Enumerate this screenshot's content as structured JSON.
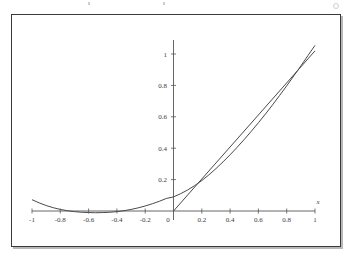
{
  "figure": {
    "frame_border_color": "#3a3a3a",
    "shadow_color": "#b8b8b8",
    "background": "#ffffff"
  },
  "chart_data": {
    "type": "line",
    "title": "",
    "subtitle": "",
    "xlabel": "x",
    "ylabel": "",
    "grid": false,
    "legend": false,
    "legend_position": "none",
    "xlim": [
      -1,
      1
    ],
    "ylim": [
      -0.06,
      1.08
    ],
    "x_ticks": [
      -1,
      -0.8,
      -0.6,
      -0.4,
      -0.2,
      0,
      0.2,
      0.4,
      0.6,
      0.8,
      1
    ],
    "x_tick_labels": [
      "-1",
      "-0.8",
      "-0.6",
      "-0.4",
      "-0.2",
      "0",
      "0.2",
      "0.4",
      "0.6",
      "0.8",
      "1"
    ],
    "y_ticks": [
      0.2,
      0.4,
      0.6,
      0.8,
      1
    ],
    "y_tick_labels": [
      "0.2",
      "0.4",
      "0.6",
      "0.8",
      "1"
    ],
    "axis_color": "#555555",
    "curve_color": "#4a4a4a",
    "series": [
      {
        "name": "curve",
        "kind": "curve",
        "color": "#4a4a4a",
        "x": [
          -1.0,
          -0.95,
          -0.9,
          -0.85,
          -0.8,
          -0.75,
          -0.7,
          -0.65,
          -0.6,
          -0.55,
          -0.5,
          -0.45,
          -0.4,
          -0.35,
          -0.3,
          -0.25,
          -0.2,
          -0.15,
          -0.1,
          -0.05,
          0.0,
          0.05,
          0.1,
          0.15,
          0.2,
          0.25,
          0.3,
          0.35,
          0.4,
          0.45,
          0.5,
          0.55,
          0.6,
          0.65,
          0.7,
          0.75,
          0.8,
          0.85,
          0.9,
          0.95,
          1.0
        ],
        "y": [
          0.072,
          0.052,
          0.035,
          0.021,
          0.01,
          0.002,
          -0.004,
          -0.008,
          -0.01,
          -0.011,
          -0.01,
          -0.008,
          -0.004,
          0.002,
          0.01,
          0.02,
          0.032,
          0.046,
          0.062,
          0.08,
          0.09,
          0.11,
          0.134,
          0.162,
          0.194,
          0.23,
          0.27,
          0.313,
          0.358,
          0.406,
          0.456,
          0.508,
          0.562,
          0.618,
          0.676,
          0.736,
          0.797,
          0.86,
          0.924,
          0.99,
          1.055
        ]
      },
      {
        "name": "line",
        "kind": "straight-line",
        "color": "#4a4a4a",
        "x": [
          0.0,
          1.0
        ],
        "y": [
          0.0,
          1.02
        ]
      }
    ],
    "annotations": [
      {
        "text": "x",
        "role": "x-axis-name",
        "x": 1.03,
        "y": 0.055
      }
    ],
    "intersections": [
      {
        "x": 0.25,
        "y": 0.23
      },
      {
        "x": 0.8,
        "y": 0.8
      }
    ]
  }
}
